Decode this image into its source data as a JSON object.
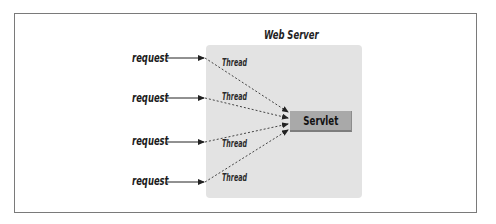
{
  "diagram": {
    "title": "Web Server",
    "servlet_label": "Servlet",
    "requests": [
      {
        "label": "request",
        "thread_label": "Thread"
      },
      {
        "label": "request",
        "thread_label": "Thread"
      },
      {
        "label": "request",
        "thread_label": "Thread"
      },
      {
        "label": "request",
        "thread_label": "Thread"
      }
    ],
    "colors": {
      "server_fill": "#e3e3e3",
      "servlet_fill": "#a9a9a9",
      "frame_border": "#7a7a7a",
      "line": "#222222"
    }
  }
}
